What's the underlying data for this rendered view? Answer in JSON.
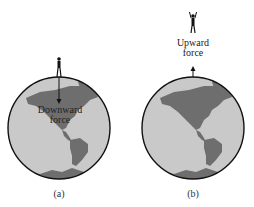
{
  "panels": [
    {
      "id": "a",
      "caption": "(a)",
      "force_label_line1": "Downward",
      "force_label_line2": "force",
      "force_direction": "down"
    },
    {
      "id": "b",
      "caption": "(b)",
      "force_label_line1": "Upward",
      "force_label_line2": "force",
      "force_direction": "up"
    }
  ],
  "colors": {
    "ocean": "#c9c9c9",
    "land": "#6e6e6e",
    "outline": "#111111",
    "text": "#222222"
  }
}
